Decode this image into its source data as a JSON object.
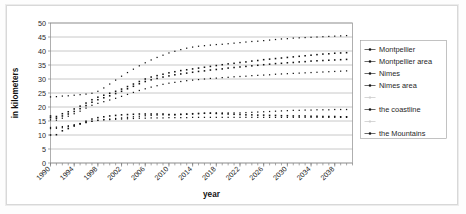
{
  "chart_data": {
    "type": "line",
    "title": "",
    "xlabel": "year",
    "ylabel": "in kilometers",
    "ylim": [
      0,
      50
    ],
    "ytick_step": 5,
    "yticks": [
      "0",
      "5",
      "10",
      "15",
      "20",
      "25",
      "30",
      "35",
      "40",
      "45",
      "50"
    ],
    "xlim": [
      1990,
      2041
    ],
    "xtick_labels": [
      "1990",
      "1994",
      "1998",
      "2002",
      "2006",
      "2010",
      "2014",
      "2018",
      "2022",
      "2026",
      "2030",
      "2034",
      "2038"
    ],
    "xtick_step": 4,
    "x_minor_step": 1,
    "grid": "horizontal",
    "legend_position": "right",
    "marker": "square",
    "monochrome": true,
    "x": [
      1990,
      1991,
      1992,
      1993,
      1994,
      1995,
      1996,
      1997,
      1998,
      1999,
      2000,
      2001,
      2002,
      2003,
      2004,
      2005,
      2006,
      2007,
      2008,
      2009,
      2010,
      2011,
      2012,
      2013,
      2014,
      2015,
      2016,
      2017,
      2018,
      2019,
      2020,
      2021,
      2022,
      2023,
      2024,
      2025,
      2026,
      2027,
      2028,
      2029,
      2030,
      2031,
      2032,
      2033,
      2034,
      2035,
      2036,
      2037,
      2038,
      2039,
      2040
    ],
    "series": [
      {
        "name": "Montpellier",
        "values": [
          12.3,
          12.4,
          12.6,
          13.0,
          13.4,
          13.9,
          14.4,
          14.9,
          15.3,
          15.5,
          15.7,
          15.9,
          16.1,
          16.3,
          16.5,
          16.7,
          16.9,
          17.0,
          17.1,
          17.2,
          17.2,
          17.2,
          17.3,
          17.4,
          17.5,
          17.6,
          17.7,
          17.8,
          17.9,
          17.9,
          17.9,
          17.9,
          17.9,
          18.0,
          18.1,
          18.2,
          18.3,
          18.4,
          18.5,
          18.6,
          18.7,
          18.8,
          18.8,
          18.9,
          18.9,
          19.0,
          19.0,
          19.0,
          19.1,
          19.1,
          19.1
        ]
      },
      {
        "name": "Montpellier area",
        "values": [
          16.8,
          16.6,
          17.6,
          18.3,
          19.3,
          20.3,
          21.4,
          22.6,
          23.5,
          24.2,
          24.9,
          25.6,
          26.4,
          27.3,
          28.2,
          29.1,
          30.0,
          30.7,
          31.2,
          31.7,
          32.2,
          32.6,
          33.0,
          33.3,
          33.6,
          33.9,
          34.2,
          34.5,
          34.8,
          35.1,
          35.4,
          35.6,
          35.9,
          36.1,
          36.4,
          36.6,
          36.9,
          37.1,
          37.3,
          37.5,
          37.7,
          37.9,
          38.1,
          38.3,
          38.5,
          38.7,
          38.9,
          39.0,
          39.2,
          39.3,
          39.4
        ]
      },
      {
        "name": "Nimes",
        "values": [
          16.2,
          16.0,
          16.8,
          17.5,
          18.4,
          19.4,
          20.5,
          21.7,
          22.6,
          23.3,
          24.0,
          24.8,
          25.6,
          26.5,
          27.4,
          28.3,
          29.1,
          29.7,
          30.2,
          30.7,
          31.1,
          31.5,
          31.8,
          32.1,
          32.4,
          32.7,
          32.9,
          33.2,
          33.4,
          33.6,
          33.9,
          34.1,
          34.3,
          34.5,
          34.7,
          34.9,
          35.1,
          35.3,
          35.5,
          35.6,
          35.8,
          35.9,
          36.1,
          36.2,
          36.4,
          36.5,
          36.6,
          36.7,
          36.8,
          36.9,
          37.0
        ]
      },
      {
        "name": "Nimes area",
        "values": [
          15.4,
          15.3,
          16.0,
          16.7,
          17.6,
          18.5,
          19.6,
          20.6,
          21.3,
          21.9,
          22.5,
          23.1,
          23.8,
          24.5,
          25.2,
          25.9,
          26.5,
          27.1,
          27.6,
          28.1,
          28.5,
          28.8,
          29.1,
          29.4,
          29.6,
          29.8,
          30.0,
          30.2,
          30.3,
          30.5,
          30.6,
          30.8,
          30.9,
          31.0,
          31.2,
          31.3,
          31.4,
          31.5,
          31.7,
          31.8,
          31.9,
          32.0,
          32.1,
          32.2,
          32.3,
          32.4,
          32.5,
          32.6,
          32.7,
          32.8,
          32.9
        ]
      },
      {
        "name": "",
        "values": [
          23.6,
          23.7,
          23.9,
          24.0,
          24.2,
          24.4,
          24.6,
          24.9,
          25.6,
          26.8,
          28.2,
          29.6,
          31.0,
          32.3,
          33.5,
          34.7,
          35.8,
          36.8,
          37.7,
          38.5,
          39.3,
          39.9,
          40.5,
          41.0,
          41.4,
          41.7,
          41.9,
          42.1,
          42.3,
          42.4,
          42.6,
          42.8,
          43.0,
          43.2,
          43.4,
          43.5,
          43.7,
          43.9,
          44.1,
          44.3,
          44.4,
          44.6,
          44.7,
          44.8,
          44.9,
          45.0,
          45.1,
          45.2,
          45.3,
          45.4,
          45.5
        ]
      },
      {
        "name": "the coastline",
        "values": [
          12.7,
          12.8,
          13.0,
          13.3,
          13.7,
          14.1,
          14.5,
          14.9,
          15.2,
          15.4,
          15.5,
          15.6,
          15.7,
          15.8,
          15.9,
          16.0,
          16.0,
          16.1,
          16.1,
          16.1,
          16.2,
          16.2,
          16.2,
          16.2,
          16.3,
          16.3,
          16.3,
          16.3,
          16.3,
          16.3,
          16.3,
          16.3,
          16.3,
          16.3,
          16.3,
          16.3,
          16.3,
          16.3,
          16.3,
          16.3,
          16.3,
          16.3,
          16.3,
          16.3,
          16.3,
          16.3,
          16.3,
          16.3,
          16.3,
          16.3,
          16.3
        ]
      },
      {
        "name": "the Mountains",
        "values": [
          10.0,
          10.1,
          11.5,
          12.3,
          13.2,
          14.0,
          14.9,
          15.7,
          16.2,
          16.5,
          16.8,
          17.0,
          17.2,
          17.3,
          17.4,
          17.5,
          17.5,
          17.5,
          17.5,
          17.5,
          17.3,
          17.3,
          17.4,
          17.5,
          17.6,
          17.7,
          17.8,
          17.8,
          17.7,
          17.6,
          17.5,
          17.4,
          17.3,
          17.2,
          17.2,
          17.1,
          17.1,
          17.0,
          17.0,
          16.9,
          16.9,
          16.8,
          16.8,
          16.8,
          16.7,
          16.7,
          16.6,
          16.6,
          16.6,
          16.5,
          16.5
        ]
      }
    ],
    "legend_entries": [
      {
        "label": "Montpellier",
        "faded": false
      },
      {
        "label": "Montpellier area",
        "faded": false
      },
      {
        "label": "Nimes",
        "faded": false
      },
      {
        "label": "Nimes area",
        "faded": false
      },
      {
        "label": "",
        "faded": true
      },
      {
        "label": "the coastline",
        "faded": false
      },
      {
        "label": "",
        "faded": true
      },
      {
        "label": "the Mountains",
        "faded": false
      }
    ],
    "colors": {
      "marker": "#111111",
      "grid": "#9a9a9a",
      "frame": "#8e8e8e",
      "background": "#ffffff"
    }
  }
}
